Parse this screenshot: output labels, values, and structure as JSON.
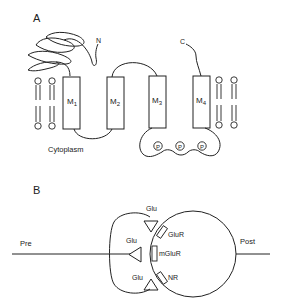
{
  "panel_a": {
    "label": "A",
    "n_terminus": "N",
    "c_terminus": "C",
    "segments": [
      {
        "main": "M",
        "sub": "1"
      },
      {
        "main": "M",
        "sub": "2"
      },
      {
        "main": "M",
        "sub": "3"
      },
      {
        "main": "M",
        "sub": "4"
      }
    ],
    "cytoplasm_label": "Cytoplasm",
    "phospho_sites": [
      "P",
      "P",
      "P"
    ]
  },
  "panel_b": {
    "label": "B",
    "pre_label": "Pre",
    "post_label": "Post",
    "glu_top": "Glu",
    "glu_middle": "Glu",
    "glu_bottom": "Glu",
    "receptor_glur": "GluR",
    "receptor_mglur": "mGluR",
    "receptor_nr": "NR"
  },
  "colors": {
    "stroke": "#222222",
    "background": "#ffffff"
  }
}
